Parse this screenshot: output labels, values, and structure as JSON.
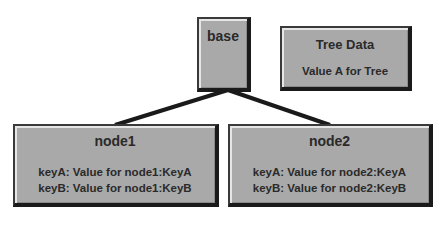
{
  "diagram": {
    "root": {
      "label": "base"
    },
    "tree_data": {
      "title": "Tree Data",
      "value": "Value A for Tree"
    },
    "nodes": [
      {
        "title": "node1",
        "lines": [
          "keyA: Value for node1:KeyA",
          "keyB: Value for node1:KeyB"
        ]
      },
      {
        "title": "node2",
        "lines": [
          "keyA: Value for node2:KeyA",
          "keyB: Value for node2:KeyB"
        ]
      }
    ],
    "colors": {
      "box_fill": "#a9a9a9",
      "border": "#1a1a1a",
      "connector": "#1a1a1a"
    }
  }
}
